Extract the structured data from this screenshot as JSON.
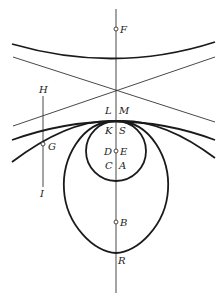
{
  "figure": {
    "colors": {
      "ink": "#1a1a1a",
      "background": "#ffffff"
    },
    "labels": {
      "F": "F",
      "H": "H",
      "G": "G",
      "I": "I",
      "L": "L",
      "M": "M",
      "K": "K",
      "S": "S",
      "D": "D",
      "E": "E",
      "C": "C",
      "A": "A",
      "B": "B",
      "R": "R"
    },
    "points": {
      "F": [
        116,
        29
      ],
      "E": [
        116,
        151
      ],
      "B": [
        116,
        222
      ],
      "G": [
        43,
        144
      ],
      "tangent_point": [
        116,
        120
      ],
      "line_crossing": [
        116,
        90
      ],
      "R": [
        116,
        253
      ]
    }
  }
}
